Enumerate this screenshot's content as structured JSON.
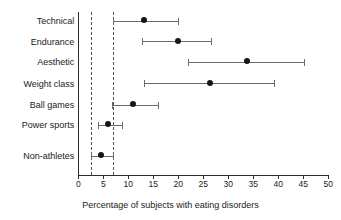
{
  "chart_data": {
    "type": "scatter",
    "title": "",
    "xlabel": "Percentage of subjects with eating disorders",
    "ylabel": "",
    "xlim": [
      0,
      50
    ],
    "xticks": [
      0,
      5,
      10,
      15,
      20,
      25,
      30,
      35,
      40,
      45,
      50
    ],
    "xtick_labels": [
      "0",
      "5",
      "10",
      "15",
      "20",
      "25",
      "30",
      "35",
      "40",
      "45",
      "50"
    ],
    "grid": false,
    "legend": null,
    "reference_lines": [
      {
        "name": "lower-reference",
        "value": 2.5,
        "style": "dashed"
      },
      {
        "name": "upper-reference",
        "value": 7.0,
        "style": "dashed"
      }
    ],
    "categories": [
      "Technical",
      "Endurance",
      "Aesthetic",
      "Weight class",
      "Ball games",
      "Power sports",
      "Non-athletes"
    ],
    "points": [
      {
        "category": "Technical",
        "value": 13.1,
        "low": 6.9,
        "high": 20.0
      },
      {
        "category": "Endurance",
        "value": 19.9,
        "low": 12.7,
        "high": 26.5
      },
      {
        "category": "Aesthetic",
        "value": 33.7,
        "low": 22.0,
        "high": 45.1
      },
      {
        "category": "Weight class",
        "value": 26.3,
        "low": 13.2,
        "high": 39.1
      },
      {
        "category": "Ball games",
        "value": 11.0,
        "low": 6.8,
        "high": 16.0
      },
      {
        "category": "Power sports",
        "value": 5.9,
        "low": 3.9,
        "high": 8.7
      },
      {
        "category": "Non-athletes",
        "value": 4.5,
        "low": 2.6,
        "high": 6.9
      }
    ],
    "colors": {
      "point": "#171717",
      "whisker": "#6b6b6b",
      "axis": "#2b2b2b",
      "reference": "#555555",
      "background": "#ffffff"
    }
  }
}
